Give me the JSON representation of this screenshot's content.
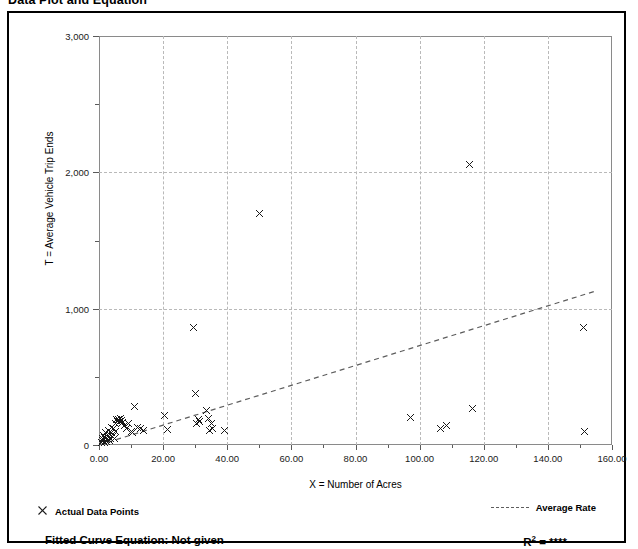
{
  "page_title": "Data Plot and Equation",
  "chart_data": {
    "type": "scatter",
    "title": "Data Plot and Equation",
    "xlabel": "X = Number of Acres",
    "ylabel": "T = Average Vehicle Trip Ends",
    "xlim": [
      0,
      160
    ],
    "ylim": [
      0,
      3000
    ],
    "x_ticks": [
      0,
      20,
      40,
      60,
      80,
      100,
      120,
      140,
      160
    ],
    "x_ticklabels": [
      "0.00",
      "20.00",
      "40.00",
      "60.00",
      "80.00",
      "100.00",
      "120.00",
      "140.00",
      "160.00"
    ],
    "x_minor_ticks": [
      10,
      30,
      50,
      70,
      90,
      110,
      130,
      150
    ],
    "y_ticks": [
      0,
      1000,
      2000,
      3000
    ],
    "y_ticklabels": [
      "0",
      "1,000",
      "2,000",
      "3,000"
    ],
    "y_minor_ticks": [
      500,
      1500,
      2500
    ],
    "grid": true,
    "grid_style": "dashed",
    "grid_color": "#b9b9b9",
    "marker": "x",
    "marker_color": "#1a1a1a",
    "legend_position": "below-axes",
    "series": [
      {
        "name": "Actual Data Points",
        "type": "scatter",
        "points": [
          [
            0.8,
            20
          ],
          [
            1.0,
            45
          ],
          [
            1.2,
            30
          ],
          [
            1.4,
            70
          ],
          [
            1.6,
            15
          ],
          [
            1.8,
            55
          ],
          [
            2.0,
            95
          ],
          [
            2.2,
            40
          ],
          [
            2.4,
            25
          ],
          [
            2.6,
            80
          ],
          [
            2.8,
            60
          ],
          [
            3.0,
            110
          ],
          [
            3.2,
            35
          ],
          [
            3.4,
            75
          ],
          [
            3.6,
            50
          ],
          [
            3.8,
            130
          ],
          [
            4.0,
            90
          ],
          [
            4.2,
            65
          ],
          [
            4.5,
            120
          ],
          [
            4.8,
            45
          ],
          [
            5.0,
            155
          ],
          [
            5.2,
            100
          ],
          [
            5.5,
            185
          ],
          [
            5.8,
            170
          ],
          [
            6.0,
            190
          ],
          [
            6.3,
            175
          ],
          [
            6.6,
            195
          ],
          [
            7.0,
            180
          ],
          [
            7.4,
            165
          ],
          [
            8.0,
            145
          ],
          [
            8.6,
            120
          ],
          [
            9.2,
            160
          ],
          [
            10.0,
            100
          ],
          [
            10.5,
            95
          ],
          [
            11.0,
            280
          ],
          [
            12.0,
            130
          ],
          [
            13.0,
            120
          ],
          [
            14.0,
            110
          ],
          [
            20.5,
            220
          ],
          [
            21.5,
            115
          ],
          [
            29.5,
            860
          ],
          [
            30.0,
            380
          ],
          [
            30.5,
            155
          ],
          [
            31.0,
            190
          ],
          [
            31.5,
            175
          ],
          [
            33.5,
            250
          ],
          [
            34.0,
            195
          ],
          [
            34.5,
            110
          ],
          [
            35.0,
            160
          ],
          [
            35.5,
            120
          ],
          [
            39.0,
            105
          ],
          [
            50.0,
            1700
          ],
          [
            97.0,
            205
          ],
          [
            106.5,
            120
          ],
          [
            108.5,
            140
          ],
          [
            115.5,
            2060
          ],
          [
            116.5,
            265
          ],
          [
            151.0,
            860
          ],
          [
            151.5,
            100
          ]
        ]
      },
      {
        "name": "Average Rate",
        "type": "line",
        "style": "dashed",
        "color": "#5d5d5d",
        "endpoints": [
          [
            0,
            0
          ],
          [
            155,
            1130
          ]
        ]
      }
    ],
    "legend": [
      {
        "key": "actual-data-points",
        "label": "Actual Data Points",
        "marker": "x"
      },
      {
        "key": "average-rate",
        "label": "Average Rate",
        "marker": "dashed-line"
      }
    ],
    "annotations": {
      "fitted_curve_label": "Fitted Curve Equation:  Not given",
      "r_squared_prefix": "R",
      "r_squared_exponent": "2",
      "r_squared_value": "= ****"
    }
  }
}
